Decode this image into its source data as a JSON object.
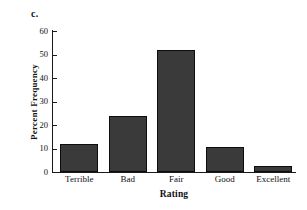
{
  "panel": {
    "label": "c."
  },
  "chart_data": {
    "type": "bar",
    "title": "",
    "panel_label": "c.",
    "categories": [
      "Terrible",
      "Bad",
      "Fair",
      "Good",
      "Excellent"
    ],
    "values": [
      12,
      24,
      52,
      10.6,
      2.6
    ],
    "xlabel": "Rating",
    "ylabel": "Percent Frequency",
    "ylim": [
      0,
      60
    ],
    "yticks": [
      0,
      10,
      20,
      30,
      40,
      50,
      60
    ],
    "ytick_labels": [
      "0",
      "10",
      "20",
      "30",
      "40",
      "50",
      "60"
    ],
    "grid": false,
    "legend": null,
    "bar_color": "#3a3a3a",
    "bar_edge_color": "#0d0d0d",
    "axis_color": "#1a1a1a",
    "background": "#ffffff"
  }
}
